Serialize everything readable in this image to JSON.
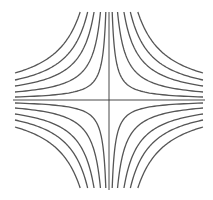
{
  "diagram": {
    "type": "hyperbola-family",
    "center": [
      109,
      100
    ],
    "half_width": 94,
    "half_height": 88,
    "c_offsets_px": [
      3,
      8,
      14,
      20,
      27
    ],
    "colors": {
      "curve": "#555555",
      "axis": "#333333",
      "background": "#ffffff"
    }
  }
}
